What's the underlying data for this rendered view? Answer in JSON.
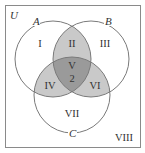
{
  "diagram": {
    "type": "venn-3-set",
    "universe_label": "U",
    "sets": [
      {
        "label": "A"
      },
      {
        "label": "B"
      },
      {
        "label": "C"
      }
    ],
    "regions": [
      {
        "id": "I",
        "label": "I",
        "value": ""
      },
      {
        "id": "II",
        "label": "II",
        "value": ""
      },
      {
        "id": "III",
        "label": "III",
        "value": ""
      },
      {
        "id": "IV",
        "label": "IV",
        "value": ""
      },
      {
        "id": "V",
        "label": "V",
        "value": "2"
      },
      {
        "id": "VI",
        "label": "VI",
        "value": ""
      },
      {
        "id": "VII",
        "label": "VII",
        "value": ""
      },
      {
        "id": "VIII",
        "label": "VIII",
        "value": ""
      }
    ],
    "colors": {
      "outline": "#7a7a7a",
      "frame": "#8a8a8a",
      "pair_shade": "#c9c9c9",
      "triple_shade": "#9a9a9a",
      "text": "#333333"
    }
  }
}
